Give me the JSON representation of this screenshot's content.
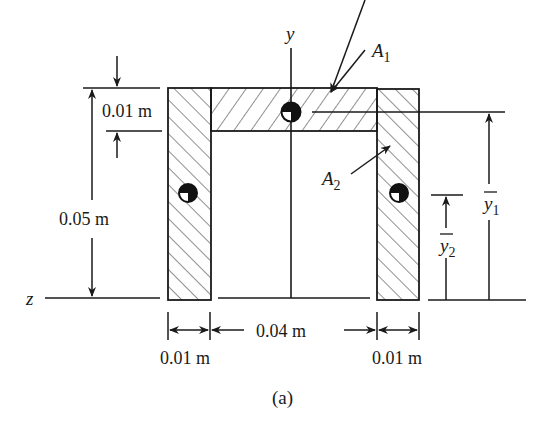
{
  "figure": {
    "caption": "(a)"
  },
  "axes": {
    "y_label": "y",
    "z_label": "z"
  },
  "areas": {
    "a1_label": "A",
    "a1_sub": "1",
    "a2_label": "A",
    "a2_sub": "2"
  },
  "dimensions": {
    "flange_thickness": "0.01 m",
    "total_height": "0.05 m",
    "left_leg_width": "0.01 m",
    "inner_width": "0.04 m",
    "right_leg_width": "0.01 m"
  },
  "centroid_distances": {
    "y1_label": "y",
    "y1_sub": "1",
    "y2_label": "y",
    "y2_sub": "2"
  },
  "colors": {
    "ink": "#1a1a1a",
    "background": "#ffffff"
  }
}
